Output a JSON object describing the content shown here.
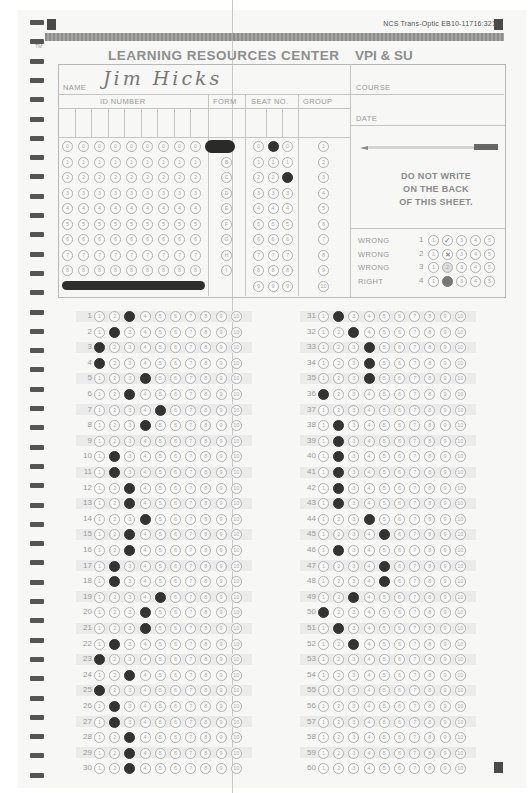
{
  "header": {
    "form_number": "NCS Trans-Optic EB10-11716:321",
    "trademark": "TM",
    "title": "LEARNING RESOURCES CENTER",
    "institution": "VPI & SU"
  },
  "fields": {
    "name_label": "NAME",
    "name_value": "Jim Hicks",
    "course_label": "COURSE",
    "course_value": "",
    "date_label": "DATE",
    "date_value": "",
    "id_number_label": "ID NUMBER",
    "form_label": "FORM",
    "seat_no_label": "SEAT NO.",
    "group_label": "GROUP"
  },
  "id_grid": {
    "columns": 9,
    "digits": [
      "0",
      "1",
      "2",
      "3",
      "4",
      "5",
      "6",
      "7",
      "8"
    ],
    "filled": []
  },
  "form_grid": {
    "options": [
      "A",
      "B",
      "C",
      "D",
      "E",
      "F",
      "G",
      "H",
      "I"
    ],
    "selected": "A"
  },
  "seat_grid": {
    "columns": 3,
    "digits": [
      "0",
      "1",
      "2",
      "3",
      "4",
      "5",
      "6",
      "7",
      "8",
      "9"
    ],
    "selected": [
      "",
      "0",
      "2"
    ]
  },
  "group_grid": {
    "options": [
      "1",
      "2",
      "3",
      "4",
      "5",
      "6",
      "7",
      "8",
      "9",
      "10"
    ],
    "selected": null
  },
  "instructions": {
    "pencil_text": "USE NO. 2 PENCIL ONLY",
    "warning_line1": "DO NOT WRITE",
    "warning_line2": "ON THE BACK",
    "warning_line3": "OF THIS SHEET."
  },
  "examples": [
    {
      "label": "WRONG",
      "num": "1",
      "mark": "check on 2"
    },
    {
      "label": "WRONG",
      "num": "2",
      "mark": "cross on 2"
    },
    {
      "label": "WRONG",
      "num": "3",
      "mark": "light fill on 2"
    },
    {
      "label": "RIGHT",
      "num": "4",
      "mark": "solid fill on 2"
    }
  ],
  "answers": {
    "choices": [
      "1",
      "2",
      "3",
      "4",
      "5",
      "6",
      "7",
      "8",
      "9",
      "10"
    ],
    "responses": {
      "1": 3,
      "2": 2,
      "3": 1,
      "4": 1,
      "5": 4,
      "6": 3,
      "7": 5,
      "8": 4,
      "9": null,
      "10": 2,
      "11": 2,
      "12": 3,
      "13": 3,
      "14": 4,
      "15": 3,
      "16": 3,
      "17": 2,
      "18": 2,
      "19": 5,
      "20": 4,
      "21": 4,
      "22": 2,
      "23": 1,
      "24": 3,
      "25": 1,
      "26": 2,
      "27": 2,
      "28": 3,
      "29": 3,
      "30": 3,
      "31": 2,
      "32": 3,
      "33": 4,
      "34": 4,
      "35": 4,
      "36": 1,
      "37": null,
      "38": 2,
      "39": 2,
      "40": 2,
      "41": 2,
      "42": 2,
      "43": 2,
      "44": 4,
      "45": 5,
      "46": 2,
      "47": 5,
      "48": 5,
      "49": 3,
      "50": 1,
      "51": 2,
      "52": 3,
      "53": null,
      "54": null,
      "55": null,
      "56": null,
      "57": null,
      "58": null,
      "59": null,
      "60": null
    }
  },
  "colors": {
    "paper": "#f7f7f6",
    "ink": "#8a8a8a",
    "mark": "#333333",
    "stripe": "#999999"
  }
}
